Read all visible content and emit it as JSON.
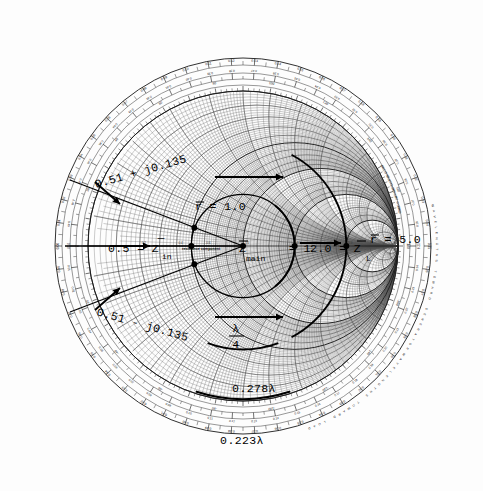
{
  "chart_data": {
    "type": "scatter",
    "subtitle": "Normalized impedance transformation with quarter-wave section",
    "xlabel": "resistance component",
    "ylabel": "reactance component",
    "chart_kind": "smith-chart",
    "grid": true,
    "legend": "none",
    "axis_label_inline": "resistance component",
    "resistance_circles": [
      0.1,
      0.2,
      0.3,
      0.4,
      0.5,
      0.6,
      0.7,
      0.8,
      0.9,
      1.0,
      1.2,
      1.4,
      1.6,
      1.8,
      2.0,
      3.0,
      4.0,
      5.0,
      10.0,
      20.0,
      50.0
    ],
    "reactance_arcs": [
      0.1,
      0.2,
      0.3,
      0.4,
      0.5,
      0.6,
      0.8,
      1.0,
      1.2,
      1.5,
      2.0,
      3.0,
      4.0,
      5.0,
      10.0,
      20.0,
      50.0
    ],
    "outer_ring_wavelength_toward_generator": [
      "0.00",
      "0.01",
      "0.02",
      "0.03",
      "0.04",
      "0.05",
      "0.06",
      "0.07",
      "0.08",
      "0.09",
      "0.10",
      "0.11",
      "0.12",
      "0.13",
      "0.14",
      "0.15",
      "0.16",
      "0.17",
      "0.18",
      "0.19",
      "0.20",
      "0.21",
      "0.22",
      "0.23",
      "0.24",
      "0.25",
      "0.26",
      "0.27",
      "0.28",
      "0.29",
      "0.30",
      "0.31",
      "0.32",
      "0.33",
      "0.34",
      "0.35",
      "0.36",
      "0.37",
      "0.38",
      "0.39",
      "0.40",
      "0.41",
      "0.42",
      "0.43",
      "0.44",
      "0.45",
      "0.46",
      "0.47",
      "0.48",
      "0.49"
    ],
    "outer_ring_wavelength_toward_load": [
      "0.50",
      "0.49",
      "0.48",
      "0.47",
      "0.46",
      "0.45",
      "0.44",
      "0.43",
      "0.42",
      "0.41",
      "0.40",
      "0.39",
      "0.38",
      "0.37",
      "0.36",
      "0.35",
      "0.34",
      "0.33",
      "0.32",
      "0.31",
      "0.30",
      "0.29",
      "0.28",
      "0.27",
      "0.26",
      "0.25",
      "0.24",
      "0.23",
      "0.22",
      "0.21",
      "0.20",
      "0.19",
      "0.18",
      "0.17",
      "0.16",
      "0.15",
      "0.14",
      "0.13",
      "0.12",
      "0.11",
      "0.10",
      "0.09",
      "0.08",
      "0.07",
      "0.06",
      "0.05",
      "0.04",
      "0.03",
      "0.02",
      "0.01"
    ],
    "angle_scale_degrees": [
      0,
      20,
      40,
      60,
      80,
      100,
      120,
      140,
      160,
      180,
      -160,
      -140,
      -120,
      -100,
      -80,
      -60,
      -40,
      -20
    ],
    "rim_label_wavelengths_toward_generator": "WAVELENGTHS TOWARD GENERATOR",
    "rim_label_wavelengths_toward_load": "WAVELENGTHS TOWARD LOAD",
    "rim_label_angle_reflection": "ANGLE OF REFLECTION COEFFICIENT IN DEGREES",
    "rim_label_angle_transmission": "ANGLE OF TRANSMISSION COEFFICIENT IN DEGREES",
    "points": [
      {
        "name": "Z_in",
        "label": "0.5 = Z̄in",
        "r": 0.5,
        "x": 0.0
      },
      {
        "name": "Z_in_upper",
        "label": "0.51 + j0.135",
        "r": 0.51,
        "x": 0.135
      },
      {
        "name": "Z_in_lower",
        "label": "0.51 - j0.135",
        "r": 0.51,
        "x": -0.135
      },
      {
        "name": "Z_main",
        "label": "Z̄main = 1",
        "r": 1.0,
        "x": 0.0
      },
      {
        "name": "Z_quarter",
        "label": "2.0 = Z̄",
        "r": 2.0,
        "x": 0.0
      },
      {
        "name": "Z_L",
        "label": "Z̄L",
        "r": 5.0,
        "x": 0.0
      }
    ],
    "swr_circles": [
      {
        "name": "r_unity",
        "label": "r̄ = 1.0",
        "value": 1.0
      },
      {
        "name": "r_five",
        "label": "r̄ = 5.0",
        "value": 5.0
      }
    ],
    "arc_distances": [
      {
        "label": "0.278λ",
        "value": 0.278
      },
      {
        "label": "0.223λ",
        "value": 0.223
      }
    ],
    "quarter_wave_marker": {
      "numerator": "λ",
      "denominator": "4"
    }
  },
  "annotations": {
    "z_in_upper": "0.51 + j0.135",
    "z_in_lower": "0.51 - j0.135",
    "z_in": "0.5 = Z",
    "z_in_sub": "in",
    "r_unity": "r = 1.0",
    "r_unity_bar": "―",
    "z_main": "Z",
    "z_main_sub": "main",
    "z_main_eq": "= 1",
    "z_two": "2.0 = Z",
    "z_l_eq": "= Z",
    "z_l_sub": "L",
    "r_five": "r = 5.0",
    "lambda_num": "λ",
    "lambda_den": "4",
    "dist_outer": "0.278λ",
    "dist_inner": "0.223λ",
    "resistance_component": "resistance component"
  },
  "rim": {
    "wavelengths_toward_generator": "WAVELENGTHS TOWARD GENERATOR",
    "wavelengths_toward_load": "WAVELENGTHS TOWARD LOAD",
    "angle_of_reflection": "ANGLE OF REFLECTION COEFFICIENT IN DEGREES",
    "angle_of_transmission": "ANGLE OF TRANSMISSION COEFFICIENT IN DEGREES"
  },
  "colors": {
    "background": "#ffffff",
    "grid_fine": "#6b6b6b",
    "grid_bold": "#1c1c1c",
    "annotation": "#000000"
  }
}
